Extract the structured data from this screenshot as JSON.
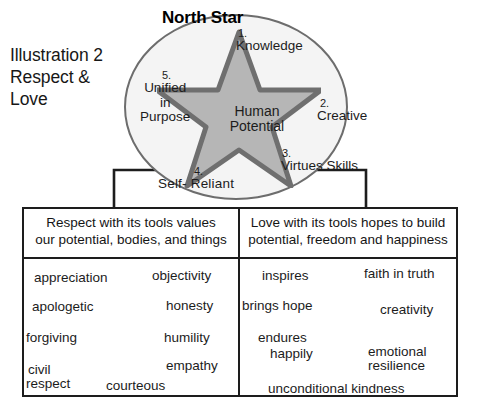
{
  "caption": {
    "line1": "Illustration 2",
    "line2": "Respect &",
    "line3": "Love"
  },
  "diagram": {
    "title": "North Star",
    "center_line1": "Human",
    "center_line2": "Potential",
    "points": [
      {
        "num": "1.",
        "label": "Knowledge"
      },
      {
        "num": "2.",
        "label": "Creative"
      },
      {
        "num": "3.",
        "label_line1": "Virtues",
        "label_line2": "Skills"
      },
      {
        "num": "4.",
        "label": "Self- Reliant"
      },
      {
        "num": "5.",
        "label_line1": "Unified",
        "label_line2": "in",
        "label_line3": "Purpose"
      }
    ]
  },
  "panels": {
    "left": {
      "head_line1": "Respect with its tools values",
      "head_line2": "our potential, bodies, and things",
      "illustration": "gift-in-hand-illustration",
      "tags": [
        "appreciation",
        "apologetic",
        "forgiving",
        "civil",
        "respect",
        "objectivity",
        "honesty",
        "humility",
        "empathy",
        "courteous"
      ]
    },
    "right": {
      "head_line1": "Love with its tools hopes to build",
      "head_line2": "potential, freedom and happiness",
      "illustration": "heart-worker-illustration",
      "tags": [
        "inspires",
        "brings hope",
        "endures",
        "happily",
        "unconditional kindness",
        "faith in truth",
        "creativity",
        "emotional",
        "resilience"
      ]
    }
  },
  "colors": {
    "star_fill": "#b6b6b6",
    "star_stroke": "#6f6f6f",
    "circle_fill": "#f4f4f4",
    "circle_stroke": "#6d6d6d",
    "panel_border": "#1d1d1d",
    "text": "#1c1c1c"
  }
}
